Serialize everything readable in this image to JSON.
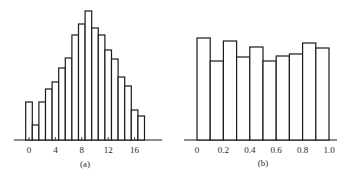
{
  "chart_data": [
    {
      "id": "a",
      "type": "bar",
      "subtype": "histogram",
      "caption": "(a)",
      "title": "",
      "xlabel": "",
      "ylabel": "",
      "x": [
        0,
        1,
        2,
        3,
        4,
        5,
        6,
        7,
        8,
        9,
        10,
        11,
        12,
        13,
        14,
        15,
        16,
        17
      ],
      "values": [
        38,
        15,
        38,
        51,
        58,
        72,
        82,
        105,
        116,
        129,
        112,
        105,
        90,
        81,
        63,
        54,
        30,
        24
      ],
      "value_units": "relative height (no y-axis shown)",
      "xticks": [
        0,
        4,
        8,
        12,
        16
      ],
      "xtick_labels": [
        "0",
        "4",
        "8",
        "12",
        "16"
      ],
      "xlim": [
        -2,
        20
      ],
      "grid": false,
      "legend": null
    },
    {
      "id": "b",
      "type": "bar",
      "subtype": "histogram",
      "caption": "(b)",
      "title": "",
      "xlabel": "",
      "ylabel": "",
      "bin_edges": [
        0,
        0.1,
        0.2,
        0.3,
        0.4,
        0.5,
        0.6,
        0.7,
        0.8,
        0.9,
        1.0
      ],
      "values": [
        102,
        79,
        99,
        83,
        93,
        79,
        84,
        86,
        97,
        92
      ],
      "value_units": "relative height (no y-axis shown)",
      "xticks": [
        0,
        0.2,
        0.4,
        0.6,
        0.8,
        1.0
      ],
      "xtick_labels": [
        "0",
        "0.2",
        "0.4",
        "0.6",
        "0.8",
        "1.0"
      ],
      "xlim": [
        -0.1,
        1.07
      ],
      "grid": false,
      "legend": null
    }
  ],
  "colors": {
    "ink": "#1a1a1a",
    "fill": "#ffffff"
  }
}
